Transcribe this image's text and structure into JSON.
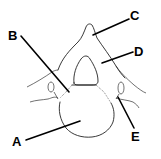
{
  "diagram": {
    "labels": [
      {
        "id": "A",
        "text": "A",
        "x": 12,
        "y": 146
      },
      {
        "id": "B",
        "text": "B",
        "x": 8,
        "y": 40
      },
      {
        "id": "C",
        "text": "C",
        "x": 130,
        "y": 20
      },
      {
        "id": "D",
        "text": "D",
        "x": 134,
        "y": 56
      },
      {
        "id": "E",
        "text": "E",
        "x": 131,
        "y": 141
      }
    ],
    "colors": {
      "line": "#000000",
      "background": "#ffffff"
    }
  }
}
